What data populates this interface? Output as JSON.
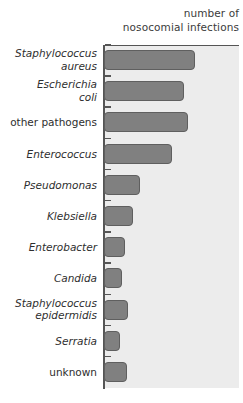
{
  "axis_title": {
    "line1": "number of",
    "line2": "nosocomial infections"
  },
  "colors": {
    "bar_fill": "#808080",
    "bar_stroke": "#5f5f5f",
    "panel_background": "#ececec",
    "axis": "#555555",
    "label_text": "#2e2e2e",
    "title_text": "#3b3b3b",
    "page_background": "#ffffff"
  },
  "chart_data": {
    "type": "bar",
    "orientation": "horizontal",
    "title": "",
    "xlabel": "number of nosocomial infections",
    "ylabel": "",
    "grid": false,
    "legend": "none",
    "xlim": [
      0,
      136
    ],
    "categories": [
      "Staphylococcus aureus",
      "Escherichia coli",
      "other pathogens",
      "Enterococcus",
      "Pseudomonas",
      "Klebsiella",
      "Enterobacter",
      "Candida",
      "Staphylococcus epidermidis",
      "Serratia",
      "unknown"
    ],
    "values": [
      91,
      80,
      84,
      68,
      36,
      29,
      21,
      18,
      24,
      16,
      23
    ],
    "bars": [
      {
        "label": "Staphylococcus aureus",
        "label_line1": "Staphylococcus",
        "label_line2": "aureus",
        "style": "italic",
        "value": 91,
        "length_px": 91
      },
      {
        "label": "Escherichia coli",
        "label_line1": "Escherichia",
        "label_line2": "coli",
        "style": "italic",
        "value": 80,
        "length_px": 80
      },
      {
        "label": "other pathogens",
        "label_line1": "other pathogens",
        "label_line2": "",
        "style": "roman",
        "value": 84,
        "length_px": 84
      },
      {
        "label": "Enterococcus",
        "label_line1": "Enterococcus",
        "label_line2": "",
        "style": "italic",
        "value": 68,
        "length_px": 68
      },
      {
        "label": "Pseudomonas",
        "label_line1": "Pseudomonas",
        "label_line2": "",
        "style": "italic",
        "value": 36,
        "length_px": 36
      },
      {
        "label": "Klebsiella",
        "label_line1": "Klebsiella",
        "label_line2": "",
        "style": "italic",
        "value": 29,
        "length_px": 29
      },
      {
        "label": "Enterobacter",
        "label_line1": "Enterobacter",
        "label_line2": "",
        "style": "italic",
        "value": 21,
        "length_px": 21
      },
      {
        "label": "Candida",
        "label_line1": "Candida",
        "label_line2": "",
        "style": "italic",
        "value": 18,
        "length_px": 18
      },
      {
        "label": "Staphylococcus epidermidis",
        "label_line1": "Staphylococcus",
        "label_line2": "epidermidis",
        "style": "italic",
        "value": 24,
        "length_px": 24
      },
      {
        "label": "Serratia",
        "label_line1": "Serratia",
        "label_line2": "",
        "style": "italic",
        "value": 16,
        "length_px": 16
      },
      {
        "label": "unknown",
        "label_line1": "unknown",
        "label_line2": "",
        "style": "roman",
        "value": 23,
        "length_px": 23
      }
    ]
  },
  "layout": {
    "plot_left_px": 103,
    "plot_top_px": 45,
    "plot_width_px": 136,
    "plot_height_px": 343,
    "bar_height_px": 20,
    "row_pitch_px": 31.2,
    "first_bar_top_px": 50
  }
}
